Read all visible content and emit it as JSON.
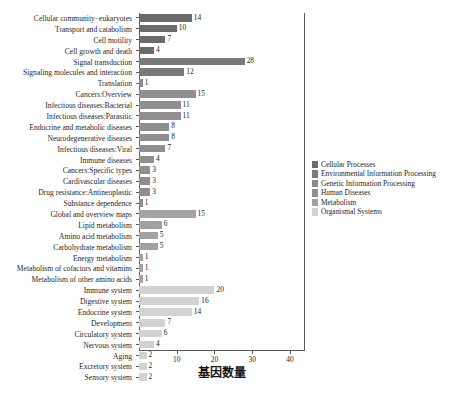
{
  "chart_data": {
    "type": "bar",
    "orientation": "horizontal",
    "title": "",
    "xlabel": "基因数量",
    "ylabel": "",
    "xlim": [
      0,
      44
    ],
    "xticks": [
      10,
      20,
      30,
      40
    ],
    "grid": false,
    "legend_position": "right",
    "categories": [
      "Cellular community−eukaryotes",
      "Transport and catabolism",
      "Cell motility",
      "Cell growth and death",
      "Signal transduction",
      "Signaling molecules and interaction",
      "Translation",
      "Cancers:Overview",
      "Infectious diseases:Bacterial",
      "Infectious diseases:Parasitic",
      "Endocrine and metabolic diseases",
      "Neurodegenerative diseases",
      "Infectious diseases:Viral",
      "Immune diseases",
      "Cancers:Specific types",
      "Cardivascular diseases",
      "Drug resistance:Antineoplastic",
      "Substance dependence",
      "Global and overview maps",
      "Lipid metabolism",
      "Amino acid  metabolism",
      "Carbohydrate metabolism",
      "Energy metabolism",
      "Metabolism of cofactors and vitamins",
      "Metabolism of other amino acids",
      "Immune system",
      "Digestive system",
      "Endocrine system",
      "Development",
      "Circulatory system",
      "Nervous system",
      "Aging",
      "Excretory system",
      "Sensory system"
    ],
    "values": [
      14,
      10,
      7,
      4,
      28,
      12,
      1,
      15,
      11,
      11,
      8,
      8,
      7,
      4,
      3,
      3,
      3,
      1,
      15,
      6,
      5,
      5,
      1,
      1,
      1,
      20,
      16,
      14,
      7,
      6,
      4,
      2,
      2,
      2
    ],
    "groups": [
      "Cellular Processes",
      "Cellular Processes",
      "Cellular Processes",
      "Cellular Processes",
      "Environmental Information Processing",
      "Environmental Information Processing",
      "Genetic Information Processing",
      "Human Diseases",
      "Human Diseases",
      "Human Diseases",
      "Human Diseases",
      "Human Diseases",
      "Human Diseases",
      "Human Diseases",
      "Human Diseases",
      "Human Diseases",
      "Human Diseases",
      "Human Diseases",
      "Metabolism",
      "Metabolism",
      "Metabolism",
      "Metabolism",
      "Metabolism",
      "Metabolism",
      "Metabolism",
      "Organismal Systems",
      "Organismal Systems",
      "Organismal Systems",
      "Organismal Systems",
      "Organismal Systems",
      "Organismal Systems",
      "Organismal Systems",
      "Organismal Systems",
      "Organismal Systems"
    ],
    "legend": [
      {
        "label": "Cellular Processes",
        "color": "#6b6b6b"
      },
      {
        "label": "Environmental Information Processing",
        "color": "#7a7a7a"
      },
      {
        "label": "Genetic Information Processing",
        "color": "#8a8a8a"
      },
      {
        "label": "Human Diseases",
        "color": "#8f8f8f"
      },
      {
        "label": "Metabolism",
        "color": "#a2a2a2"
      },
      {
        "label": "Organismal Systems",
        "color": "#d2d2d2"
      }
    ],
    "group_colors": {
      "Cellular Processes": "#6b6b6b",
      "Environmental Information Processing": "#7a7a7a",
      "Genetic Information Processing": "#8a8a8a",
      "Human Diseases": "#8f8f8f",
      "Metabolism": "#a2a2a2",
      "Organismal Systems": "#d2d2d2"
    }
  }
}
